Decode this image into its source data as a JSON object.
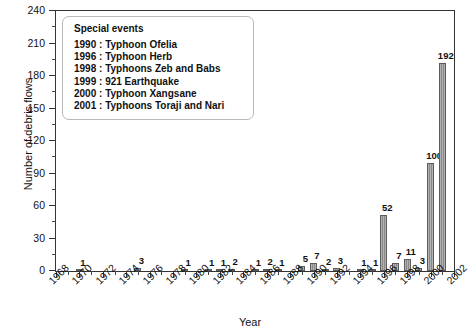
{
  "chart_data": {
    "type": "bar",
    "title": "",
    "xlabel": "Year",
    "ylabel": "Number of debris flows",
    "xlim": [
      1968,
      2002
    ],
    "ylim": [
      0,
      240
    ],
    "ytick_step": 30,
    "yminor_step": 15,
    "xtick_step": 2,
    "grid": false,
    "legend_position": "upper-left-inside",
    "ytick_labels": [
      "0",
      "30",
      "60",
      "90",
      "120",
      "150",
      "180",
      "210",
      "240"
    ],
    "xtick_labels": [
      "1968",
      "1970",
      "1972",
      "1974",
      "1976",
      "1978",
      "1980",
      "1982",
      "1984",
      "1986",
      "1988",
      "1990",
      "1992",
      "1994",
      "1996",
      "1998",
      "2000",
      "2002"
    ],
    "categories": [
      1970,
      1975,
      1979,
      1981,
      1982,
      1983,
      1985,
      1986,
      1987,
      1989,
      1990,
      1991,
      1992,
      1994,
      1995,
      1996,
      1997,
      1998,
      1999,
      2000,
      2001
    ],
    "values": [
      1,
      3,
      1,
      1,
      1,
      2,
      1,
      2,
      1,
      5,
      7,
      2,
      3,
      1,
      1,
      52,
      7,
      11,
      3,
      100,
      192
    ],
    "bar_color": "#909090",
    "bar_edge_color": "#5c5c5c",
    "axis_color": "#333333"
  },
  "legend": {
    "title": "Special events",
    "entries": [
      "1990 : Typhoon Ofelia",
      "1996 : Typhoon Herb",
      "1998 : Typhoons Zeb and Babs",
      "1999 : 921 Earthquake",
      "2000 : Typhoon Xangsane",
      "2001 : Typhoons Toraji and Nari"
    ]
  }
}
